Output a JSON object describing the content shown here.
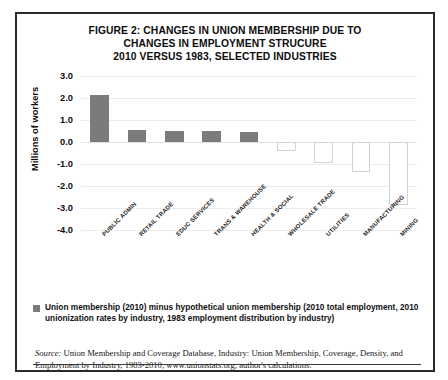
{
  "figure": {
    "title_lines": [
      "FIGURE 2: CHANGES IN UNION MEMBERSHIP DUE TO",
      "CHANGES IN EMPLOYMENT STRUCURE",
      "2010 VERSUS 1983, SELECTED INDUSTRIES"
    ],
    "legend_label": "Union membership (2010) minus hypothetical union membership (2010 total employment, 2010 unionization rates by industry, 1983 employment distribution by industry)",
    "legend_swatch_color": "#7b7b7b",
    "source_label": "Source:",
    "source_text": " Union Membership and Coverage Database, Industry: Union Membership, Coverage, Density, and Employment by Industry, 1983-2010, www.unionstats.org; author's calculations."
  },
  "chart_data": {
    "type": "bar",
    "title": "FIGURE 2: CHANGES IN UNION MEMBERSHIP DUE TO CHANGES IN EMPLOYMENT STRUCURE 2010 VERSUS 1983, SELECTED INDUSTRIES",
    "xlabel": "",
    "ylabel": "Millions of workers",
    "categories": [
      "PUBLIC ADMIN",
      "RETAIL TRADE",
      "EDUC SERVICES",
      "TRANS & WAREHOUSE",
      "HEALTH & SOCIAL",
      "WHOLESALE TRADE",
      "UTILITIES",
      "MANUFACTURING",
      "MINING"
    ],
    "values": [
      2.15,
      0.55,
      0.52,
      0.5,
      0.45,
      -0.4,
      -0.95,
      -1.35,
      -2.85
    ],
    "ylim": [
      -4.0,
      3.0
    ],
    "ytick_labels": [
      "3.0",
      "2.0",
      "1.0",
      "0.0",
      "-1.0",
      "-2.0",
      "-3.0",
      "-4.0"
    ],
    "ytick_values": [
      3.0,
      2.0,
      1.0,
      0.0,
      -1.0,
      -2.0,
      -3.0,
      -4.0
    ],
    "grid": true,
    "legend_position": "below-plot",
    "series": [
      {
        "name": "Union membership (2010) minus hypothetical union membership",
        "values": [
          2.15,
          0.55,
          0.52,
          0.5,
          0.45,
          -0.4,
          -0.95,
          -1.35,
          -2.85
        ],
        "positive_fill": "#7b7b7b",
        "negative_fill": "#ffffff",
        "negative_stroke": "#d2d2d2"
      }
    ]
  }
}
